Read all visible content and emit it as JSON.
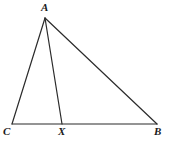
{
  "figure": {
    "background_color": "#ffffff",
    "stroke_color": "#2b2b2b",
    "stroke_width": 1.2,
    "canvas": {
      "width": 170,
      "height": 146
    },
    "points": {
      "A": {
        "label": "A",
        "x": 45,
        "y": 18
      },
      "B": {
        "label": "B",
        "x": 157,
        "y": 124
      },
      "C": {
        "label": "C",
        "x": 12,
        "y": 124
      },
      "X": {
        "label": "X",
        "x": 62,
        "y": 124
      }
    },
    "segments": [
      {
        "name": "segment-CA",
        "from": "C",
        "to": "A"
      },
      {
        "name": "segment-AB",
        "from": "A",
        "to": "B"
      },
      {
        "name": "segment-CB",
        "from": "C",
        "to": "B"
      },
      {
        "name": "segment-AX",
        "from": "A",
        "to": "X"
      }
    ],
    "labels": {
      "A": "A",
      "B": "B",
      "C": "C",
      "X": "X"
    }
  }
}
